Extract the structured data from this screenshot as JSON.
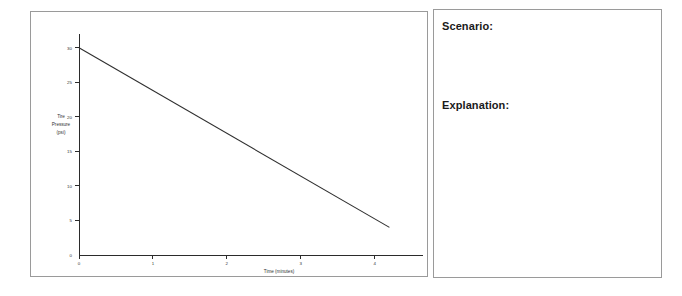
{
  "worksheet": {
    "chart_panel_name": "chart-panel",
    "answer_panel_name": "answer-panel"
  },
  "prompts": {
    "scenario_label": "Scenario:",
    "explanation_label": "Explanation:",
    "scenario_answer": "",
    "explanation_answer": ""
  },
  "colors": {
    "line": "#2f2f2f",
    "axis": "#2b2b2b",
    "border": "#9a9a9a",
    "text": "#1a1a1a",
    "background": "#ffffff"
  },
  "chart_data": {
    "type": "line",
    "title": "",
    "xlabel": "Time (minutes)",
    "ylabel": "Tire Pressure (psi)",
    "ylabel_lines": [
      "Tire",
      "Pressure",
      "(psi)"
    ],
    "x": [
      0,
      4.2
    ],
    "y": [
      30,
      4
    ],
    "series": [
      {
        "name": "Tire Pressure",
        "points": [
          {
            "x": 0,
            "y": 30
          },
          {
            "x": 4.2,
            "y": 4
          }
        ],
        "values": [
          30,
          4
        ]
      }
    ],
    "xlim": [
      0,
      4.6
    ],
    "ylim": [
      0,
      32
    ],
    "xticks": [
      0,
      1,
      2,
      3,
      4
    ],
    "yticks": [
      0,
      5,
      10,
      15,
      20,
      25,
      30
    ],
    "xtick_labels": [
      "0",
      "1",
      "2",
      "3",
      "4"
    ],
    "ytick_labels": [
      "0",
      "5",
      "10",
      "15",
      "20",
      "25",
      "30"
    ],
    "grid": false,
    "legend": false,
    "legend_position": "none",
    "annotations": []
  }
}
